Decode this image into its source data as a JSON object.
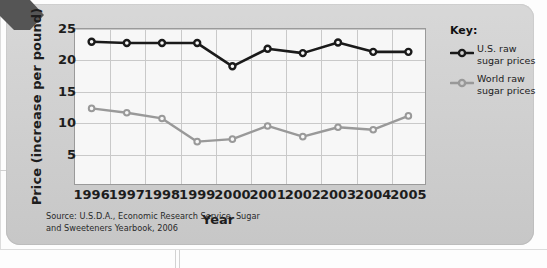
{
  "figure": {
    "y_axis_title": "Price (increase per pound)",
    "x_axis_title": "Year",
    "source_note": "Source: U.S.D.A., Economic Research Service, Sugar and Sweeteners Yearbook, 2006",
    "legend_title": "Key:"
  },
  "legend": {
    "items": [
      {
        "label": "U.S. raw sugar prices",
        "color": "#1a1a1a"
      },
      {
        "label": "World raw sugar prices",
        "color": "#999999"
      }
    ]
  },
  "chart_data": {
    "type": "line",
    "title": "",
    "xlabel": "Year",
    "ylabel": "Price (increase per pound)",
    "categories": [
      "1996",
      "1997",
      "1998",
      "1999",
      "2000",
      "2001",
      "2002",
      "2003",
      "2004",
      "2005"
    ],
    "x": [
      1996,
      1997,
      1998,
      1999,
      2000,
      2001,
      2002,
      2003,
      2004,
      2005
    ],
    "ylim": [
      0,
      25
    ],
    "yticks": [
      5,
      10,
      15,
      20,
      25
    ],
    "grid": true,
    "legend_position": "right",
    "series": [
      {
        "name": "U.S. raw sugar prices",
        "color": "#1a1a1a",
        "marker": "circle-open",
        "values": [
          22.8,
          22.6,
          22.6,
          22.6,
          18.9,
          21.7,
          21.0,
          22.7,
          21.2,
          21.2
        ]
      },
      {
        "name": "World raw sugar prices",
        "color": "#999999",
        "marker": "circle-open",
        "values": [
          12.2,
          11.5,
          10.6,
          6.9,
          7.3,
          9.4,
          7.7,
          9.2,
          8.8,
          11.0
        ]
      }
    ]
  }
}
